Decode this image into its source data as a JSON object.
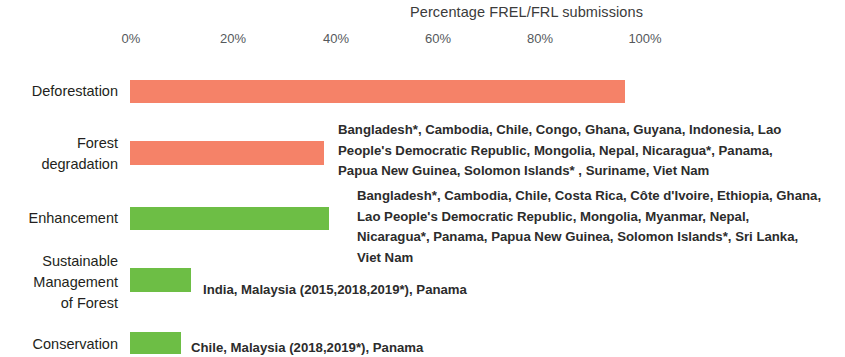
{
  "chart_data": {
    "type": "bar",
    "orientation": "horizontal",
    "title": "Percentage FREL/FRL submissions",
    "xlabel": "",
    "ylabel": "",
    "xlim": [
      0,
      100
    ],
    "grid": false,
    "legend": "none",
    "xticks": [
      "0%",
      "20%",
      "40%",
      "60%",
      "80%",
      "100%"
    ],
    "xtick_values": [
      0,
      20,
      40,
      60,
      80,
      100
    ],
    "categories": [
      "Deforestation",
      "Forest\ndegradation",
      "Enhancement",
      "Sustainable\nManagement\nof Forest",
      "Conservation"
    ],
    "values": [
      97,
      38,
      39,
      12,
      10
    ],
    "colors": [
      "#F58268",
      "#F58268",
      "#6DBE45",
      "#6DBE45",
      "#6DBE45"
    ],
    "bar_colors": {
      "salmon": "#F58268",
      "green": "#6DBE45"
    },
    "annotations": [
      {
        "category": "Forest degradation",
        "text": "Bangladesh*, Cambodia, Chile, Congo, Ghana, Guyana, Indonesia, Lao\nPeople's Democratic Republic, Mongolia, Nepal, Nicaragua*, Panama,\nPapua New Guinea, Solomon Islands* , Suriname, Viet Nam"
      },
      {
        "category": "Enhancement",
        "text": "Bangladesh*, Cambodia, Chile, Costa Rica, Côte d'Ivoire, Ethiopia, Ghana,\nLao People's Democratic Republic,  Mongolia, Myanmar, Nepal,\nNicaragua*, Panama, Papua New Guinea, Solomon Islands*, Sri Lanka,\nViet Nam"
      },
      {
        "category": "Sustainable Management of Forest",
        "text": "India, Malaysia (2015,2018,2019*),  Panama"
      },
      {
        "category": "Conservation",
        "text": "Chile, Malaysia (2018,2019*),  Panama"
      }
    ]
  },
  "axis": {
    "tick0": "0%",
    "tick1": "20%",
    "tick2": "40%",
    "tick3": "60%",
    "tick4": "80%",
    "tick5": "100%"
  },
  "categories": {
    "deforestation": "Deforestation",
    "forest_degradation": "Forest\ndegradation",
    "enhancement": "Enhancement",
    "sustainable_management": "Sustainable\nManagement\nof Forest",
    "conservation": "Conservation"
  },
  "annotations": {
    "forest_degradation": "Bangladesh*, Cambodia, Chile, Congo, Ghana, Guyana, Indonesia, Lao\nPeople's Democratic Republic, Mongolia, Nepal, Nicaragua*, Panama,\nPapua New Guinea, Solomon Islands* , Suriname, Viet Nam",
    "enhancement": "Bangladesh*, Cambodia, Chile, Costa Rica, Côte d'Ivoire, Ethiopia, Ghana,\nLao People's Democratic Republic,  Mongolia, Myanmar, Nepal,\nNicaragua*, Panama, Papua New Guinea, Solomon Islands*, Sri Lanka,\nViet Nam",
    "sustainable_management": "India, Malaysia (2015,2018,2019*),  Panama",
    "conservation": "Chile, Malaysia (2018,2019*),  Panama"
  },
  "title": "Percentage FREL/FRL submissions"
}
